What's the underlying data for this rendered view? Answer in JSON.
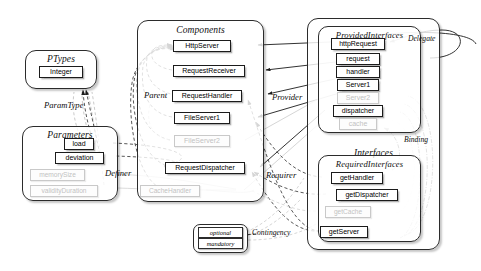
{
  "diagram": {
    "containers": [
      {
        "id": "ptypes",
        "label": "PTypes"
      },
      {
        "id": "parameters",
        "label": "Parameters"
      },
      {
        "id": "components",
        "label": "Components"
      },
      {
        "id": "interfaces",
        "label": "Interfaces"
      },
      {
        "id": "provided",
        "label": "ProvidedInterfaces"
      },
      {
        "id": "required",
        "label": "RequiredInterfaces"
      }
    ],
    "ptypes": {
      "title": "PTypes",
      "nodes": [
        {
          "label": "Integer",
          "state": "active"
        }
      ]
    },
    "parameters": {
      "title": "Parameters",
      "nodes": [
        {
          "label": "load",
          "state": "active"
        },
        {
          "label": "deviation",
          "state": "active"
        },
        {
          "label": "memorySize",
          "state": "dim"
        },
        {
          "label": "validityDuration",
          "state": "dim"
        }
      ]
    },
    "components": {
      "title": "Components",
      "nodes": [
        {
          "label": "HttpServer",
          "state": "active"
        },
        {
          "label": "RequestReceiver",
          "state": "active"
        },
        {
          "label": "RequestHandler",
          "state": "active"
        },
        {
          "label": "FileServer1",
          "state": "active"
        },
        {
          "label": "FileServer2",
          "state": "dim"
        },
        {
          "label": "RequestDispatcher",
          "state": "active"
        },
        {
          "label": "CacheHandler",
          "state": "dim"
        }
      ]
    },
    "interfaces": {
      "title": "Interfaces"
    },
    "provided": {
      "title": "ProvidedInterfaces",
      "nodes": [
        {
          "label": "httpRequest",
          "state": "active"
        },
        {
          "label": "request",
          "state": "active"
        },
        {
          "label": "handler",
          "state": "active"
        },
        {
          "label": "Server1",
          "state": "active"
        },
        {
          "label": "Server2",
          "state": "dim"
        },
        {
          "label": "dispatcher",
          "state": "active"
        },
        {
          "label": "cache",
          "state": "dim"
        }
      ]
    },
    "required": {
      "title": "RequiredInterfaces",
      "nodes": [
        {
          "label": "getHandler",
          "state": "active"
        },
        {
          "label": "getDispatcher",
          "state": "active"
        },
        {
          "label": "getCache",
          "state": "dim"
        },
        {
          "label": "getServer",
          "state": "active"
        }
      ]
    },
    "contingency": {
      "label": "Contingency",
      "nodes": [
        {
          "label": "optional"
        },
        {
          "label": "mandatory"
        }
      ]
    },
    "edge_labels": [
      {
        "id": "paramtype",
        "label": "ParamType"
      },
      {
        "id": "parent",
        "label": "Parent"
      },
      {
        "id": "provider",
        "label": "Provider"
      },
      {
        "id": "requirer",
        "label": "Requirer"
      },
      {
        "id": "definer",
        "label": "Definer"
      },
      {
        "id": "delegate",
        "label": "Delegate"
      },
      {
        "id": "binding",
        "label": "Binding"
      },
      {
        "id": "contingency",
        "label": "Contingency"
      }
    ],
    "colors": {
      "stroke": "#1b1b1b",
      "dim_stroke": "#c9c9c9",
      "node_fill": "#ffffff",
      "background": "#ffffff",
      "dashed_edge": "#3a3a3a",
      "dim_edge": "#bdbdbd"
    }
  }
}
